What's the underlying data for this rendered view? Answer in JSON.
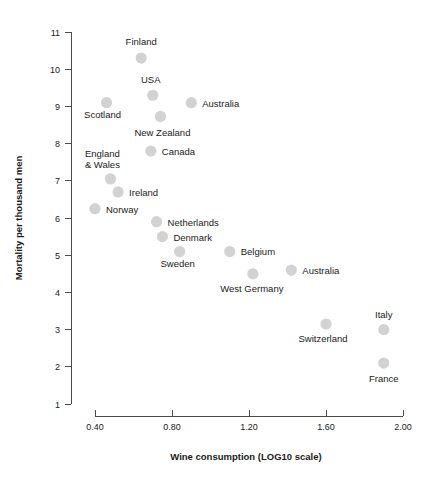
{
  "chart_data": {
    "type": "scatter",
    "title": "",
    "xlabel": "Wine consumption  (LOG10 scale)",
    "ylabel": "Mortality per thousand men",
    "xlim": [
      0.3,
      2.05
    ],
    "ylim": [
      1,
      11
    ],
    "grid": false,
    "legend": "none",
    "xticks": [
      "0.40",
      "0.80",
      "1.20",
      "1.60",
      "2.00"
    ],
    "xtick_values": [
      0.4,
      0.8,
      1.2,
      1.6,
      2.0
    ],
    "yticks": [
      "11",
      "10",
      "9",
      "8",
      "7",
      "6",
      "5",
      "4",
      "3",
      "2",
      "1"
    ],
    "ytick_values": [
      11,
      10,
      9,
      8,
      7,
      6,
      5,
      4,
      3,
      2,
      1
    ],
    "marker_color": "#d2d2d2",
    "axis_color": "#4a4a4a",
    "points": [
      {
        "label": "Finland",
        "x": 0.64,
        "y": 10.3,
        "label_dx": 0,
        "label_dy": -13,
        "anchor": "middle"
      },
      {
        "label": "USA",
        "x": 0.7,
        "y": 9.3,
        "label_dx": -2,
        "label_dy": -12,
        "anchor": "middle"
      },
      {
        "label": "Australia",
        "x": 0.9,
        "y": 9.1,
        "label_dx": 11,
        "label_dy": 4,
        "anchor": "start"
      },
      {
        "label": "Scotland",
        "x": 0.46,
        "y": 9.1,
        "label_dx": -4,
        "label_dy": 15,
        "anchor": "middle"
      },
      {
        "label": "New Zealand",
        "x": 0.74,
        "y": 8.73,
        "label_dx": 2,
        "label_dy": 20,
        "anchor": "middle"
      },
      {
        "label": "Canada",
        "x": 0.69,
        "y": 7.8,
        "label_dx": 11,
        "label_dy": 4,
        "anchor": "start"
      },
      {
        "label": "England\n& Wales",
        "x": 0.48,
        "y": 7.05,
        "label_dx": -8,
        "label_dy": -22,
        "anchor": "middle"
      },
      {
        "label": "Ireland",
        "x": 0.52,
        "y": 6.7,
        "label_dx": 11,
        "label_dy": 4,
        "anchor": "start"
      },
      {
        "label": "Norway",
        "x": 0.4,
        "y": 6.25,
        "label_dx": 11,
        "label_dy": 4,
        "anchor": "start"
      },
      {
        "label": "Netherlands",
        "x": 0.72,
        "y": 5.9,
        "label_dx": 11,
        "label_dy": 4,
        "anchor": "start"
      },
      {
        "label": "Denmark",
        "x": 0.75,
        "y": 5.5,
        "label_dx": 11,
        "label_dy": 4,
        "anchor": "start"
      },
      {
        "label": "Sweden",
        "x": 0.84,
        "y": 5.1,
        "label_dx": -2,
        "label_dy": 16,
        "anchor": "middle"
      },
      {
        "label": "Belgium",
        "x": 1.1,
        "y": 5.1,
        "label_dx": 11,
        "label_dy": 4,
        "anchor": "start"
      },
      {
        "label": "West Germany",
        "x": 1.22,
        "y": 4.5,
        "label_dx": -1,
        "label_dy": 18,
        "anchor": "middle"
      },
      {
        "label": "Australia",
        "x": 1.42,
        "y": 4.6,
        "label_dx": 11,
        "label_dy": 4,
        "anchor": "start"
      },
      {
        "label": "Switzerland",
        "x": 1.6,
        "y": 3.15,
        "label_dx": -3,
        "label_dy": 18,
        "anchor": "middle"
      },
      {
        "label": "Italy",
        "x": 1.9,
        "y": 3.0,
        "label_dx": 0,
        "label_dy": -12,
        "anchor": "middle"
      },
      {
        "label": "France",
        "x": 1.9,
        "y": 2.1,
        "label_dx": 0,
        "label_dy": 19,
        "anchor": "middle"
      }
    ]
  }
}
